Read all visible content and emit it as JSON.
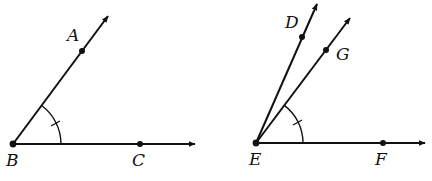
{
  "figures": [
    {
      "name": "angle-ABC",
      "vertex": {
        "label": "B",
        "x": 13,
        "y": 144
      },
      "points": [
        {
          "label": "A",
          "x": 82,
          "y": 51
        },
        {
          "label": "C",
          "x": 140,
          "y": 144
        }
      ],
      "rays": [
        {
          "from": "B",
          "through": "A",
          "tip": [
            109,
            15
          ]
        },
        {
          "from": "B",
          "through": "C",
          "tip": [
            196,
            144
          ]
        }
      ],
      "angle_mark": {
        "arc_between": [
          "BA",
          "BC"
        ],
        "ticks": 1
      }
    },
    {
      "name": "angle-DEF-with-bisector-like-ray-EG",
      "vertex": {
        "label": "E",
        "x": 256,
        "y": 143
      },
      "points": [
        {
          "label": "D",
          "x": 302,
          "y": 37
        },
        {
          "label": "G",
          "x": 326,
          "y": 50
        },
        {
          "label": "F",
          "x": 383,
          "y": 143
        }
      ],
      "rays": [
        {
          "from": "E",
          "through": "D",
          "tip": [
            318,
            3
          ]
        },
        {
          "from": "E",
          "through": "G",
          "tip": [
            351,
            17
          ]
        },
        {
          "from": "E",
          "through": "F",
          "tip": [
            426,
            143
          ]
        }
      ],
      "angle_mark": {
        "arc_between": [
          "EG",
          "EF"
        ],
        "ticks": 1
      }
    }
  ],
  "labels": {
    "A": "A",
    "B": "B",
    "C": "C",
    "D": "D",
    "E": "E",
    "F": "F",
    "G": "G"
  }
}
